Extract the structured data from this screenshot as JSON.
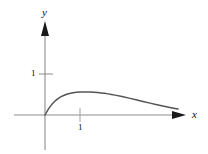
{
  "figure": {
    "background_color": "#ffffff",
    "axis_color": "#7f7f7f",
    "arrow_color": "#1a1a1a",
    "curve_color": "#4d4d4d",
    "tick_color": "#8a8a8a",
    "text_color": "#111111"
  },
  "axes": {
    "x_label": "x",
    "y_label": "y",
    "origin_px": {
      "x": 45,
      "y": 115
    },
    "unit_px": {
      "x": 35,
      "y": 41
    },
    "x_axis_range_px": {
      "start": 14,
      "end": 185
    },
    "y_axis_range_px": {
      "start": 150,
      "end": 22
    }
  },
  "ticks": {
    "y": [
      {
        "label": "1",
        "value": 1,
        "px_y": 74
      }
    ],
    "x": [
      {
        "label": "1",
        "value": 1,
        "px_x": 80
      }
    ]
  },
  "chart_data": {
    "type": "line",
    "title": "",
    "subtitle": "",
    "xlabel": "x",
    "ylabel": "y",
    "xlim": [
      -0.9,
      4.0
    ],
    "ylim": [
      -0.85,
      2.3
    ],
    "grid": false,
    "legend": null,
    "x_ticks": [
      1
    ],
    "x_tick_labels": [
      "1"
    ],
    "y_ticks": [
      1
    ],
    "y_tick_labels": [
      "1"
    ],
    "annotations": [],
    "series": [
      {
        "name": "curve",
        "description": "rises from the origin to a maximum then decays asymptotically toward the x-axis",
        "x": [
          0.0,
          0.1,
          0.2,
          0.3,
          0.4,
          0.5,
          0.6,
          0.7,
          0.8,
          0.9,
          1.0,
          1.1,
          1.2,
          1.3,
          1.4,
          1.5,
          1.6,
          1.7,
          1.8,
          1.9,
          2.0,
          2.2,
          2.4,
          2.6,
          2.8,
          3.0,
          3.2,
          3.4,
          3.6,
          3.8
        ],
        "y": [
          0.0,
          0.15,
          0.265,
          0.352,
          0.417,
          0.465,
          0.5,
          0.525,
          0.543,
          0.554,
          0.561,
          0.564,
          0.564,
          0.561,
          0.556,
          0.548,
          0.539,
          0.528,
          0.515,
          0.501,
          0.485,
          0.45,
          0.412,
          0.372,
          0.331,
          0.29,
          0.25,
          0.212,
          0.177,
          0.146
        ],
        "peak": {
          "x": 1.28,
          "y": 0.565
        }
      }
    ]
  }
}
